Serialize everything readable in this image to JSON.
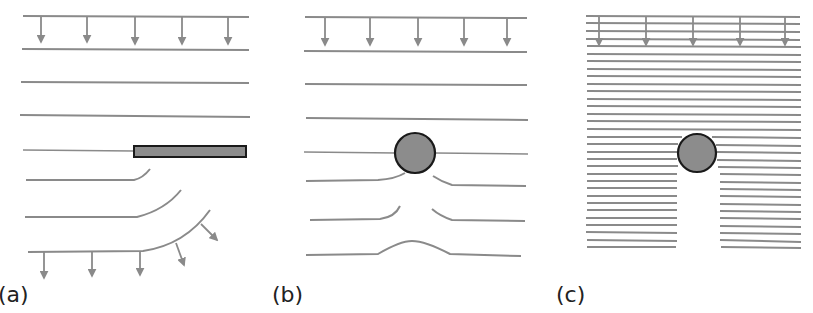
{
  "colors": {
    "line": "#8a8a8a",
    "obstacle_fill": "#8c8c8c",
    "obstacle_stroke": "#1a1a1a",
    "label": "#222222"
  },
  "panels": [
    {
      "id": "a",
      "label": "(a)",
      "obstacle": "rectangular plate",
      "arrows_top": 5,
      "arrows_bottom": 5
    },
    {
      "id": "b",
      "label": "(b)",
      "obstacle": "circular object",
      "arrows_top": 5,
      "arrows_bottom": 0
    },
    {
      "id": "c",
      "label": "(c)",
      "obstacle": "circular object",
      "arrows_top": 5,
      "arrows_bottom": 0
    }
  ]
}
